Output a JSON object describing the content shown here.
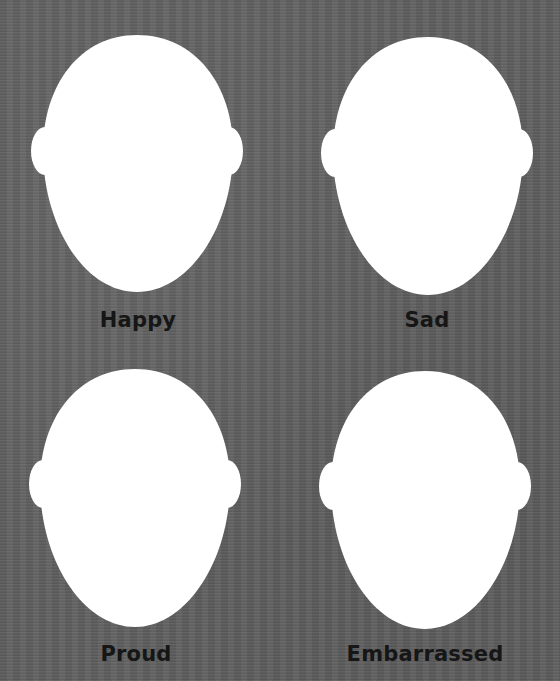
{
  "worksheet": {
    "background_color": "#606060",
    "face_color": "#ffffff",
    "label_color": "#161616",
    "faces": [
      {
        "emotion": "Happy",
        "icon": "blank-face-icon"
      },
      {
        "emotion": "Sad",
        "icon": "blank-face-icon"
      },
      {
        "emotion": "Proud",
        "icon": "blank-face-icon"
      },
      {
        "emotion": "Embarrassed",
        "icon": "blank-face-icon"
      }
    ]
  }
}
